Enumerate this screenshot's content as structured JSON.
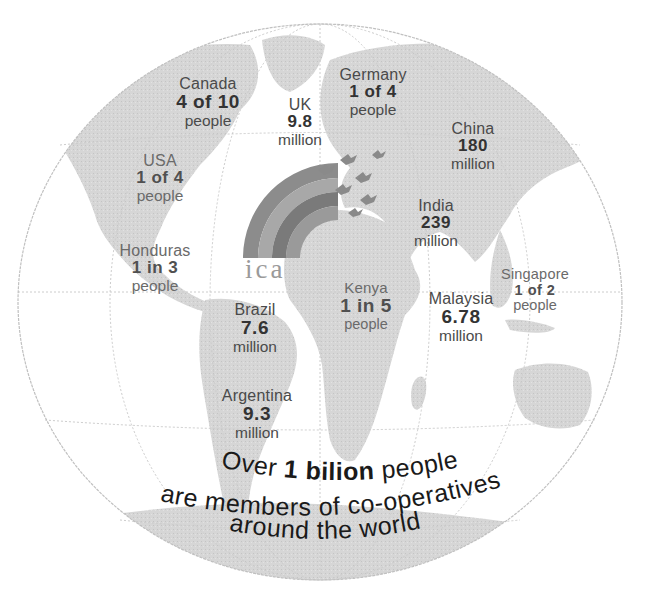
{
  "logo": {
    "text": "ica"
  },
  "stats": [
    {
      "id": "canada",
      "country": "Canada",
      "value": "4 of 10",
      "unit": "people"
    },
    {
      "id": "uk",
      "country": "UK",
      "value": "9.8",
      "unit": "million"
    },
    {
      "id": "germany",
      "country": "Germany",
      "value": "1 of 4",
      "unit": "people"
    },
    {
      "id": "china",
      "country": "China",
      "value": "180",
      "unit": "million"
    },
    {
      "id": "usa",
      "country": "USA",
      "value": "1 of 4",
      "unit": "people"
    },
    {
      "id": "india",
      "country": "India",
      "value": "239",
      "unit": "million"
    },
    {
      "id": "honduras",
      "country": "Honduras",
      "value": "1 in 3",
      "unit": "people"
    },
    {
      "id": "singapore",
      "country": "Singapore",
      "value": "1 of 2",
      "unit": "people"
    },
    {
      "id": "kenya",
      "country": "Kenya",
      "value": "1 in 5",
      "unit": "people"
    },
    {
      "id": "malaysia",
      "country": "Malaysia",
      "value": "6.78",
      "unit": "million"
    },
    {
      "id": "brazil",
      "country": "Brazil",
      "value": "7.6",
      "unit": "million"
    },
    {
      "id": "argentina",
      "country": "Argentina",
      "value": "9.3",
      "unit": "million"
    }
  ],
  "slogan": {
    "line1_prefix": "Over ",
    "line1_bold": "1 bilion",
    "line1_suffix": " people",
    "line2": "are members of co-operatives",
    "line3": "around the world"
  },
  "colors": {
    "land": "#d4d4d4",
    "grid": "#c8c8c8",
    "text_dark": "#1a1a1a"
  }
}
